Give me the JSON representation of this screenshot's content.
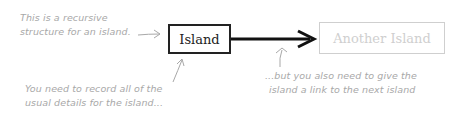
{
  "diagram": {
    "nodes": [
      {
        "id": "island",
        "label": "Island",
        "style": "solid"
      },
      {
        "id": "another_island",
        "label": "Another Island",
        "style": "faded"
      }
    ],
    "edges": [
      {
        "from": "island",
        "to": "another_island",
        "style": "bold-arrow"
      }
    ],
    "annotations": {
      "recursive_line1": "This is a recursive",
      "recursive_line2": "structure for an island.",
      "details_line1": "You need to record all of the",
      "details_line2": "usual details for the island...",
      "link_line1": "...but you also need to give the",
      "link_line2": "island a link to the next island"
    },
    "colors": {
      "primary": "#222222",
      "faded": "#cfcfcf",
      "annotation": "#a8a8a8"
    }
  }
}
